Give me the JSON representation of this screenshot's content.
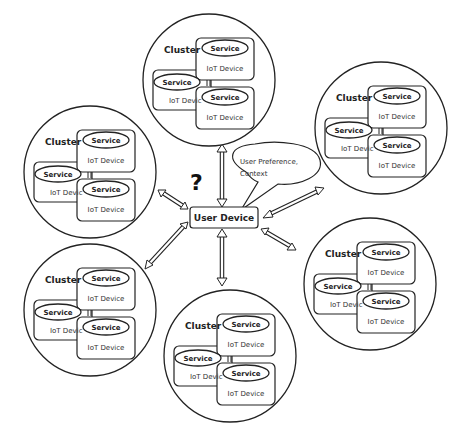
{
  "diagram": {
    "center_node": {
      "label": "User Device"
    },
    "speech_bubble": {
      "line1": "User Preference,",
      "line2": "Context"
    },
    "question_mark": "?",
    "clusters": [
      {
        "id": "top",
        "label": "Cluster",
        "service": "Service",
        "device": "IoT Device",
        "device_clipped": "IoT Devic"
      },
      {
        "id": "top-right",
        "label": "Cluster",
        "service": "Service",
        "device": "IoT Device",
        "device_clipped": "IoT Devic"
      },
      {
        "id": "left",
        "label": "Cluster",
        "service": "Service",
        "device": "IoT Device",
        "device_clipped": "IoT Devic"
      },
      {
        "id": "right",
        "label": "Cluster",
        "service": "Service",
        "device": "IoT Device",
        "device_clipped": "IoT Devic"
      },
      {
        "id": "bottom-left",
        "label": "Cluster",
        "service": "Service",
        "device": "IoT Device",
        "device_clipped": "IoT Devic"
      },
      {
        "id": "bottom",
        "label": "Cluster",
        "service": "Service",
        "device": "IoT Device",
        "device_clipped": "IoT Devic"
      }
    ],
    "colors": {
      "stroke": "#222222",
      "background": "#ffffff"
    }
  }
}
